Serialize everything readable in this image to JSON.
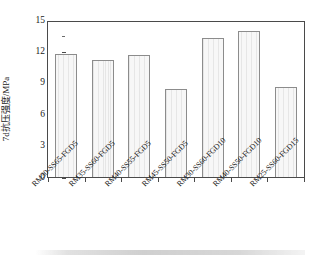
{
  "chart_data": {
    "type": "bar",
    "title": "",
    "xlabel": "",
    "ylabel": "7d抗压强度/MPa",
    "ylim": [
      0,
      15
    ],
    "yticks": [
      0,
      3,
      6,
      9,
      12,
      15
    ],
    "ytick_labels": [
      "0",
      "3",
      "6",
      "9",
      "12",
      "15"
    ],
    "minor_ticks": true,
    "grid": false,
    "legend": null,
    "categories": [
      "RM30-SS65-FGD5",
      "RM35-SS60-FGD5",
      "RM40-SS55-FGD5",
      "RM45-SS50-FGD5",
      "RM30-SS60-FGD10",
      "RM40-SS50-FGD10",
      "RM25-SS60-FGD15"
    ],
    "values": [
      11.9,
      11.3,
      11.8,
      8.5,
      13.5,
      14.1,
      8.7
    ],
    "bar_fill_color": "#f2f2f2",
    "bar_edge_color": "#8c8c8c",
    "axis_color": "#4a4a4a"
  },
  "axis": {
    "y_title": "7d抗压强度/MPa",
    "y_labels": [
      "15",
      "12",
      "9",
      "6",
      "3",
      "0"
    ]
  }
}
